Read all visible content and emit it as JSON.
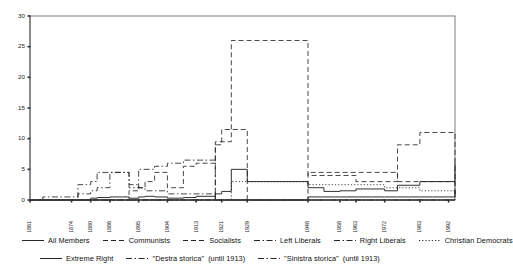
{
  "chart_data": {
    "type": "line",
    "title": "",
    "subtitle": "",
    "xlabel": "",
    "ylabel": "",
    "ylim": [
      0,
      30
    ],
    "yticks": [
      0,
      5,
      10,
      15,
      20,
      25,
      30
    ],
    "ytick_labels": [
      "0",
      "5",
      "10",
      "15",
      "20",
      "25",
      "30"
    ],
    "grid": false,
    "legend_position": "bottom",
    "step_style": "post",
    "x": [
      1861,
      1865,
      1867,
      1870,
      1874,
      1876,
      1880,
      1882,
      1886,
      1890,
      1892,
      1895,
      1897,
      1900,
      1904,
      1909,
      1913,
      1919,
      1921,
      1924,
      1929,
      1934,
      1946,
      1948,
      1953,
      1958,
      1963,
      1968,
      1972,
      1976,
      1979,
      1983,
      1987,
      1992,
      1994
    ],
    "xtick_years": [
      1861,
      1874,
      1880,
      1886,
      1895,
      1904,
      1913,
      1921,
      1929,
      1948,
      1958,
      1963,
      1972,
      1983,
      1992
    ],
    "xtick_labels": [
      "1861",
      "1874",
      "1880",
      "1886",
      "1895",
      "1904",
      "1913",
      "1921",
      "1929",
      "1948",
      "1958",
      "1963",
      "1972",
      "1983",
      "1992"
    ],
    "series": [
      {
        "name": "All Members",
        "style": "solid",
        "values": [
          0,
          0,
          0,
          0,
          0,
          0,
          0.3,
          0.4,
          0.5,
          0.5,
          0.3,
          0.5,
          0.6,
          0.5,
          0.3,
          0.4,
          0.6,
          1.0,
          1.4,
          5.0,
          3.0,
          3.0,
          3.0,
          2.0,
          1.4,
          1.5,
          1.8,
          1.8,
          1.5,
          2.4,
          2.4,
          3.0,
          3.0,
          3.0,
          6.0
        ]
      },
      {
        "name": "Communists",
        "style": "dashed",
        "values": [
          0,
          0,
          0,
          0,
          0,
          0,
          0,
          0,
          0,
          0,
          0,
          0,
          0,
          0,
          0,
          0,
          0,
          9.5,
          9.5,
          26.0,
          26.0,
          26.0,
          26.0,
          4.0,
          4.0,
          4.0,
          3.0,
          3.0,
          3.0,
          9.0,
          9.0,
          11.0,
          11.0,
          11.0,
          0.5
        ]
      },
      {
        "name": "Socialists",
        "style": "dashed",
        "values": [
          0,
          0,
          0,
          0,
          0,
          0,
          0,
          0,
          0,
          0,
          1.5,
          2.0,
          3.0,
          4.5,
          2.0,
          5.5,
          6.0,
          9.0,
          11.5,
          11.5,
          0,
          0,
          0,
          4.5,
          4.5,
          4.5,
          4.5,
          4.5,
          4.5,
          3.0,
          3.0,
          3.0,
          3.0,
          3.0,
          0.5
        ]
      },
      {
        "name": "Left Liberals",
        "style": "dashdot",
        "values": [
          0,
          0,
          0,
          0,
          0,
          0,
          0,
          0,
          0,
          0,
          0,
          0,
          0,
          0,
          0,
          0,
          0,
          0,
          0,
          0,
          0,
          0,
          0,
          0,
          0,
          0,
          0,
          0,
          0,
          0,
          0,
          0,
          0,
          0,
          0
        ]
      },
      {
        "name": "Right Liberals",
        "style": "dashdot",
        "values": [
          0,
          0,
          0,
          0,
          0,
          0,
          0,
          0,
          0,
          0,
          0,
          0,
          0,
          0,
          0,
          0,
          0,
          0,
          0,
          0,
          0,
          0,
          0,
          0,
          0,
          0,
          0,
          0,
          0,
          0,
          0,
          0,
          0,
          0,
          0
        ]
      },
      {
        "name": "Christian Democrats",
        "style": "dotted",
        "values": [
          0,
          0,
          0,
          0,
          0,
          0,
          0,
          0,
          0,
          0,
          0,
          0,
          0,
          0,
          0,
          0,
          0,
          0,
          0,
          3.0,
          3.0,
          3.0,
          3.0,
          2.5,
          2.5,
          2.5,
          2.5,
          2.5,
          2.0,
          2.0,
          2.0,
          1.5,
          1.5,
          1.5,
          0
        ]
      },
      {
        "name": "Extreme Right",
        "style": "solid",
        "values": [
          0,
          0,
          0,
          0,
          0,
          0,
          0,
          0,
          0,
          0,
          0,
          0,
          0,
          0,
          0,
          0,
          0,
          0,
          0,
          0,
          0,
          0,
          0,
          0.5,
          0.5,
          0.5,
          0.5,
          0.5,
          0.5,
          0.5,
          0.5,
          0.5,
          0.5,
          0.5,
          1.5
        ]
      },
      {
        "name": "\"Destra storica\"",
        "style": "dashdot",
        "note": "(until 1913)",
        "values": [
          0,
          0,
          0,
          0,
          0,
          1.0,
          1.5,
          2.0,
          4.5,
          4.5,
          2.5,
          2.0,
          1.5,
          1.5,
          1.0,
          1.0,
          1.0,
          0,
          0,
          0,
          0,
          0,
          0,
          0,
          0,
          0,
          0,
          0,
          0,
          0,
          0,
          0,
          0,
          0,
          0
        ]
      },
      {
        "name": "\"Sinistra storica\"",
        "style": "dashdot",
        "note": "(until 1913)",
        "values": [
          0,
          0.5,
          0.5,
          0.5,
          0.5,
          2.5,
          3.0,
          4.5,
          4.5,
          4.5,
          2.0,
          5.0,
          5.0,
          5.5,
          6.0,
          6.5,
          6.5,
          0,
          0,
          0,
          0,
          0,
          0,
          0,
          0,
          0,
          0,
          0,
          0,
          0,
          0,
          0,
          0,
          0,
          0
        ]
      }
    ]
  },
  "legend": {
    "row1": [
      {
        "label": "All Members",
        "style": "solid"
      },
      {
        "label": "Communists",
        "style": "dashed"
      },
      {
        "label": "Socialists",
        "style": "dashed"
      },
      {
        "label": "Left Liberals",
        "style": "dashdot"
      },
      {
        "label": "Right Liberals",
        "style": "dashdot"
      },
      {
        "label": "Christian Democrats",
        "style": "dotted"
      }
    ],
    "row2": [
      {
        "label": "Extreme Right",
        "style": "solid",
        "note": ""
      },
      {
        "label": "\"Destra storica\"",
        "style": "dashdot",
        "note": "(until 1913)"
      },
      {
        "label": "\"Sinistra storica\"",
        "style": "dashdot",
        "note": "(until 1913)"
      }
    ]
  },
  "colors": {
    "line": "#262626",
    "axis": "#4a4a4a",
    "frame": "#6d6d6d",
    "background": "#ffffff"
  }
}
